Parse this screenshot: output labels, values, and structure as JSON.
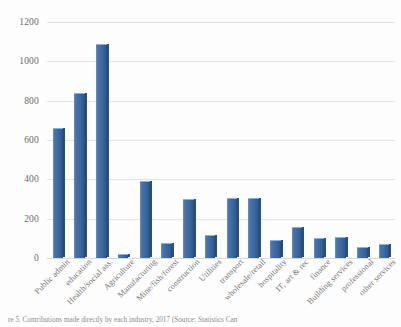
{
  "chart_data": {
    "type": "bar",
    "title": "",
    "xlabel": "",
    "ylabel": "",
    "ylim": [
      0,
      1200
    ],
    "yticks": [
      0,
      200,
      400,
      600,
      800,
      1000,
      1200
    ],
    "grid": true,
    "legend": "none",
    "series_color": "#3d6aa3",
    "categories": [
      "Public admin",
      "education",
      "Health/social ass.",
      "Agriculture",
      "Manufacturing",
      "Mine/fish/forest",
      "construction",
      "Utilities",
      "transport",
      "wholesale/retail",
      "hospitality",
      "IT, art & rec",
      "finance",
      "Building services",
      "professional",
      "other services"
    ],
    "values": [
      655,
      835,
      1085,
      15,
      385,
      70,
      295,
      110,
      300,
      300,
      85,
      155,
      95,
      100,
      50,
      65
    ]
  },
  "caption": {
    "text": "re 5. Contributions made directly by each industry, 2017 (Source: Statistics Can"
  }
}
